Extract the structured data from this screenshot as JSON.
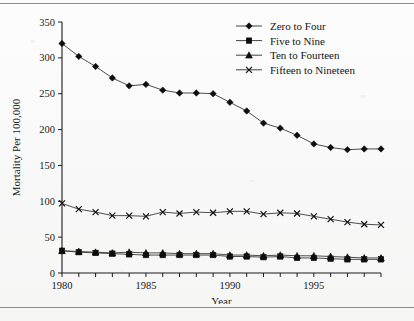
{
  "figure": {
    "name": "child-mortality-by-age-group-line-chart"
  },
  "chart_data": {
    "type": "line",
    "title": "",
    "xlabel": "Year",
    "ylabel": "Mortality Per 100,000",
    "xlim": [
      1980,
      1999
    ],
    "ylim": [
      0,
      350
    ],
    "yticks": [
      0,
      50,
      100,
      150,
      200,
      250,
      300,
      350
    ],
    "ytick_labels": [
      "0",
      "50",
      "100",
      "150",
      "200",
      "250",
      "300",
      "350"
    ],
    "xticks": [
      1980,
      1981,
      1982,
      1983,
      1984,
      1985,
      1986,
      1987,
      1988,
      1989,
      1990,
      1991,
      1992,
      1993,
      1994,
      1995,
      1996,
      1997,
      1998,
      1999
    ],
    "xtick_labels_shown": [
      "1980",
      "1985",
      "1990",
      "1995"
    ],
    "grid": false,
    "legend_position": "top-right",
    "x": [
      1980,
      1981,
      1982,
      1983,
      1984,
      1985,
      1986,
      1987,
      1988,
      1989,
      1990,
      1991,
      1992,
      1993,
      1994,
      1995,
      1996,
      1997,
      1998,
      1999
    ],
    "series": [
      {
        "name": "Zero to Four",
        "marker": "diamond",
        "values": [
          320,
          302,
          288,
          272,
          261,
          263,
          255,
          251,
          251,
          250,
          238,
          226,
          209,
          202,
          192,
          180,
          175,
          172,
          173,
          173
        ]
      },
      {
        "name": "Five to Nine",
        "marker": "square",
        "values": [
          31,
          29,
          28,
          27,
          26,
          25,
          25,
          25,
          25,
          25,
          23,
          23,
          22,
          23,
          21,
          21,
          20,
          19,
          19,
          19
        ]
      },
      {
        "name": "Ten to Fourteen",
        "marker": "triangle",
        "values": [
          31,
          30,
          29,
          28,
          29,
          28,
          28,
          27,
          27,
          27,
          25,
          25,
          24,
          25,
          24,
          24,
          23,
          22,
          21,
          21
        ]
      },
      {
        "name": "Fifteen to Nineteen",
        "marker": "x",
        "values": [
          97,
          89,
          85,
          80,
          80,
          79,
          85,
          83,
          85,
          84,
          86,
          86,
          82,
          84,
          83,
          79,
          75,
          71,
          68,
          67
        ]
      }
    ],
    "legend": [
      {
        "label": "Zero to Four",
        "marker": "diamond"
      },
      {
        "label": "Five to Nine",
        "marker": "square"
      },
      {
        "label": "Ten to Fourteen",
        "marker": "triangle"
      },
      {
        "label": "Fifteen to Nineteen",
        "marker": "x"
      }
    ],
    "colors": {
      "line": "#3a3a3a",
      "marker": "#0d0d0d",
      "axis": "#1c1c1c",
      "text": "#1a1a1a",
      "background": "#fbfbfb"
    }
  }
}
